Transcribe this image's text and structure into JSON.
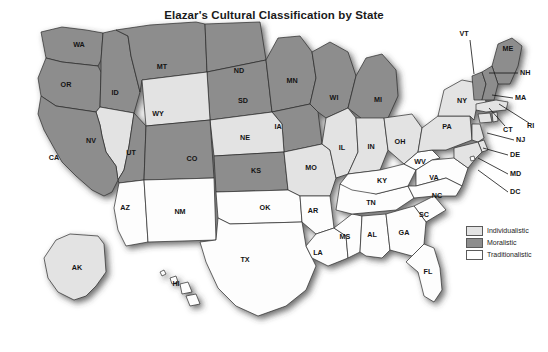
{
  "map": {
    "title": "Elazar's Cultural Classification by State",
    "colors": {
      "individualistic": "#e3e3e3",
      "moralistic": "#8d8d8d",
      "traditionalistic": "#fdfdfd",
      "border": "#2b2b2b",
      "background": "#ffffff"
    },
    "legend": {
      "items": [
        {
          "label": "Individualistic",
          "color": "#e3e3e3",
          "key": "individualistic"
        },
        {
          "label": "Moralistic",
          "color": "#8d8d8d",
          "key": "moralistic"
        },
        {
          "label": "Traditionalistic",
          "color": "#fdfdfd",
          "key": "traditionalistic"
        }
      ]
    },
    "categories": {
      "individualistic": [
        "NV",
        "WY",
        "NE",
        "MO",
        "IL",
        "IN",
        "OH",
        "PA",
        "NY",
        "MA",
        "CT",
        "RI",
        "NJ",
        "DE",
        "MD",
        "AK"
      ],
      "moralistic": [
        "WA",
        "OR",
        "ID",
        "MT",
        "ND",
        "SD",
        "CA",
        "UT",
        "CO",
        "KS",
        "MN",
        "IA",
        "WI",
        "MI",
        "VT",
        "NH",
        "ME"
      ],
      "traditionalistic": [
        "AZ",
        "NM",
        "TX",
        "OK",
        "AR",
        "LA",
        "MS",
        "AL",
        "TN",
        "KY",
        "WV",
        "VA",
        "NC",
        "SC",
        "GA",
        "FL",
        "DC",
        "HI"
      ]
    },
    "states": [
      {
        "code": "WA",
        "name": "Washington",
        "class": "moralistic",
        "label_x": 79,
        "label_y": 45
      },
      {
        "code": "OR",
        "name": "Oregon",
        "class": "moralistic",
        "label_x": 66,
        "label_y": 85
      },
      {
        "code": "ID",
        "name": "Idaho",
        "class": "moralistic",
        "label_x": 115,
        "label_y": 93
      },
      {
        "code": "MT",
        "name": "Montana",
        "class": "moralistic",
        "label_x": 162,
        "label_y": 67
      },
      {
        "code": "ND",
        "name": "North Dakota",
        "class": "moralistic",
        "label_x": 239,
        "label_y": 71
      },
      {
        "code": "SD",
        "name": "South Dakota",
        "class": "moralistic",
        "label_x": 243,
        "label_y": 101
      },
      {
        "code": "MN",
        "name": "Minnesota",
        "class": "moralistic",
        "label_x": 292,
        "label_y": 81
      },
      {
        "code": "WI",
        "name": "Wisconsin",
        "class": "moralistic",
        "label_x": 334,
        "label_y": 98
      },
      {
        "code": "MI",
        "name": "Michigan",
        "class": "moralistic",
        "label_x": 378,
        "label_y": 100
      },
      {
        "code": "IA",
        "name": "Iowa",
        "class": "moralistic",
        "label_x": 278,
        "label_y": 127
      },
      {
        "code": "NE",
        "name": "Nebraska",
        "class": "individualistic",
        "label_x": 245,
        "label_y": 138
      },
      {
        "code": "WY",
        "name": "Wyoming",
        "class": "individualistic",
        "label_x": 158,
        "label_y": 114
      },
      {
        "code": "NV",
        "name": "Nevada",
        "class": "individualistic",
        "label_x": 91,
        "label_y": 141
      },
      {
        "code": "UT",
        "name": "Utah",
        "class": "moralistic",
        "label_x": 131,
        "label_y": 153
      },
      {
        "code": "CA",
        "name": "California",
        "class": "moralistic",
        "label_x": 54,
        "label_y": 158
      },
      {
        "code": "CO",
        "name": "Colorado",
        "class": "moralistic",
        "label_x": 192,
        "label_y": 159
      },
      {
        "code": "KS",
        "name": "Kansas",
        "class": "moralistic",
        "label_x": 256,
        "label_y": 171
      },
      {
        "code": "MO",
        "name": "Missouri",
        "class": "individualistic",
        "label_x": 311,
        "label_y": 168
      },
      {
        "code": "IL",
        "name": "Illinois",
        "class": "individualistic",
        "label_x": 342,
        "label_y": 148
      },
      {
        "code": "IN",
        "name": "Indiana",
        "class": "individualistic",
        "label_x": 371,
        "label_y": 147
      },
      {
        "code": "OH",
        "name": "Ohio",
        "class": "individualistic",
        "label_x": 400,
        "label_y": 142
      },
      {
        "code": "AZ",
        "name": "Arizona",
        "class": "traditionalistic",
        "label_x": 125,
        "label_y": 208
      },
      {
        "code": "NM",
        "name": "New Mexico",
        "class": "traditionalistic",
        "label_x": 180,
        "label_y": 212
      },
      {
        "code": "OK",
        "name": "Oklahoma",
        "class": "traditionalistic",
        "label_x": 265,
        "label_y": 208
      },
      {
        "code": "AR",
        "name": "Arkansas",
        "class": "traditionalistic",
        "label_x": 313,
        "label_y": 211
      },
      {
        "code": "TX",
        "name": "Texas",
        "class": "traditionalistic",
        "label_x": 245,
        "label_y": 260
      },
      {
        "code": "LA",
        "name": "Louisiana",
        "class": "traditionalistic",
        "label_x": 318,
        "label_y": 253
      },
      {
        "code": "MS",
        "name": "Mississippi",
        "class": "traditionalistic",
        "label_x": 345,
        "label_y": 237
      },
      {
        "code": "AL",
        "name": "Alabama",
        "class": "traditionalistic",
        "label_x": 372,
        "label_y": 235
      },
      {
        "code": "TN",
        "name": "Tennessee",
        "class": "traditionalistic",
        "label_x": 371,
        "label_y": 203
      },
      {
        "code": "KY",
        "name": "Kentucky",
        "class": "traditionalistic",
        "label_x": 382,
        "label_y": 181
      },
      {
        "code": "WV",
        "name": "West Virginia",
        "class": "traditionalistic",
        "label_x": 420,
        "label_y": 162
      },
      {
        "code": "VA",
        "name": "Virginia",
        "class": "traditionalistic",
        "label_x": 434,
        "label_y": 178
      },
      {
        "code": "NC",
        "name": "North Carolina",
        "class": "traditionalistic",
        "label_x": 437,
        "label_y": 196
      },
      {
        "code": "SC",
        "name": "South Carolina",
        "class": "traditionalistic",
        "label_x": 424,
        "label_y": 215
      },
      {
        "code": "GA",
        "name": "Georgia",
        "class": "traditionalistic",
        "label_x": 404,
        "label_y": 233
      },
      {
        "code": "FL",
        "name": "Florida",
        "class": "traditionalistic",
        "label_x": 428,
        "label_y": 272
      },
      {
        "code": "PA",
        "name": "Pennsylvania",
        "class": "individualistic",
        "label_x": 447,
        "label_y": 127
      },
      {
        "code": "NY",
        "name": "New York",
        "class": "individualistic",
        "label_x": 462,
        "label_y": 101
      },
      {
        "code": "VT",
        "name": "Vermont",
        "class": "moralistic",
        "label_x": 470,
        "label_y": 34
      },
      {
        "code": "ME",
        "name": "Maine",
        "class": "moralistic",
        "label_x": 508,
        "label_y": 49
      },
      {
        "code": "NH",
        "name": "New Hampshire",
        "class": "moralistic",
        "label_x": 531,
        "label_y": 73
      },
      {
        "code": "MA",
        "name": "Massachusetts",
        "class": "individualistic",
        "label_x": 525,
        "label_y": 98
      },
      {
        "code": "CT",
        "name": "Connecticut",
        "class": "individualistic",
        "label_x": 511,
        "label_y": 130
      },
      {
        "code": "RI",
        "name": "Rhode Island",
        "class": "individualistic",
        "label_x": 532,
        "label_y": 126
      },
      {
        "code": "NJ",
        "name": "New Jersey",
        "class": "individualistic",
        "label_x": 524,
        "label_y": 140
      },
      {
        "code": "DE",
        "name": "Delaware",
        "class": "individualistic",
        "label_x": 518,
        "label_y": 155
      },
      {
        "code": "MD",
        "name": "Maryland",
        "class": "individualistic",
        "label_x": 518,
        "label_y": 174
      },
      {
        "code": "DC",
        "name": "District of Columbia",
        "class": "traditionalistic",
        "label_x": 518,
        "label_y": 192
      },
      {
        "code": "AK",
        "name": "Alaska",
        "class": "individualistic",
        "label_x": 77,
        "label_y": 268
      },
      {
        "code": "HI",
        "name": "Hawaii",
        "class": "traditionalistic",
        "label_x": 176,
        "label_y": 284
      }
    ],
    "callouts": [
      {
        "code": "VT",
        "text_x": 464,
        "text_y": 34,
        "anchor": "middle",
        "line": "M 470,40 L 474,74"
      },
      {
        "code": "NH",
        "text_x": 520,
        "text_y": 73,
        "anchor": "start",
        "line": "M 518,73 L 489,73"
      },
      {
        "code": "MA",
        "text_x": 515,
        "text_y": 98,
        "anchor": "start",
        "line": "M 513,98 L 492,95"
      },
      {
        "code": "RI",
        "text_x": 527,
        "text_y": 126,
        "anchor": "start",
        "line": "M 529,123 L 499,104"
      },
      {
        "code": "CT",
        "text_x": 503,
        "text_y": 130,
        "anchor": "start",
        "line": "M 505,126 L 489,108"
      },
      {
        "code": "NJ",
        "text_x": 516,
        "text_y": 140,
        "anchor": "start",
        "line": "M 514,140 L 487,133"
      },
      {
        "code": "DE",
        "text_x": 510,
        "text_y": 155,
        "anchor": "start",
        "line": "M 508,155 L 483,148"
      },
      {
        "code": "MD",
        "text_x": 510,
        "text_y": 174,
        "anchor": "start",
        "line": "M 508,174 L 478,158"
      },
      {
        "code": "DC",
        "text_x": 510,
        "text_y": 192,
        "anchor": "start",
        "line": "M 508,192 L 478,170"
      }
    ]
  }
}
